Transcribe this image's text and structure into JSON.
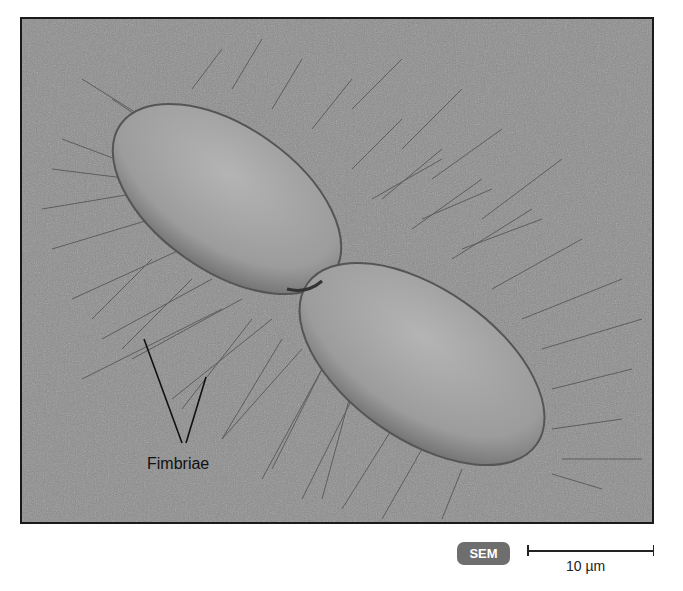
{
  "figure": {
    "background_color": "#8a8a8a",
    "cell_color": "#a6a6a6",
    "label": "Fimbriae",
    "badge": "SEM",
    "badge_color": "#6e6e6e",
    "scale_bar": {
      "label": "10 µm"
    }
  }
}
